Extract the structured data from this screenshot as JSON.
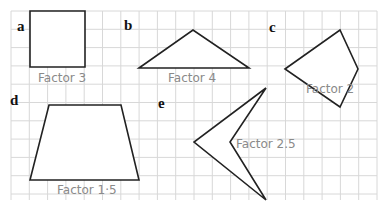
{
  "grid": {
    "x0": 11,
    "y0": 11,
    "x1": 377,
    "y1": 200,
    "step": 18.3,
    "color": "#d8d8d8"
  },
  "shapes": [
    {
      "id": "a",
      "label": "a",
      "factor_text": "Factor 3",
      "label_pos": [
        17,
        31
      ],
      "factor_pos": [
        38,
        82
      ],
      "points": "30,11 85,11 85,67 30,67"
    },
    {
      "id": "b",
      "label": "b",
      "factor_text": "Factor 4",
      "label_pos": [
        124,
        30
      ],
      "factor_pos": [
        168,
        82
      ],
      "points": "139,68 193,30 249,68"
    },
    {
      "id": "c",
      "label": "c",
      "factor_text": "Factor 2",
      "label_pos": [
        269,
        32
      ],
      "factor_pos": [
        306,
        93
      ],
      "points": "285,69 340,30 358,69 340,107"
    },
    {
      "id": "d",
      "label": "d",
      "factor_text": "Factor 1·5",
      "label_pos": [
        10,
        105
      ],
      "factor_pos": [
        57,
        194
      ],
      "points": "49,105 121,105 139,180 30,180"
    },
    {
      "id": "e",
      "label": "e",
      "factor_text": "Factor 2.5",
      "label_pos": [
        158,
        108
      ],
      "factor_pos": [
        236,
        148
      ],
      "points": "266,88 230,142 266,200 194,142"
    }
  ]
}
